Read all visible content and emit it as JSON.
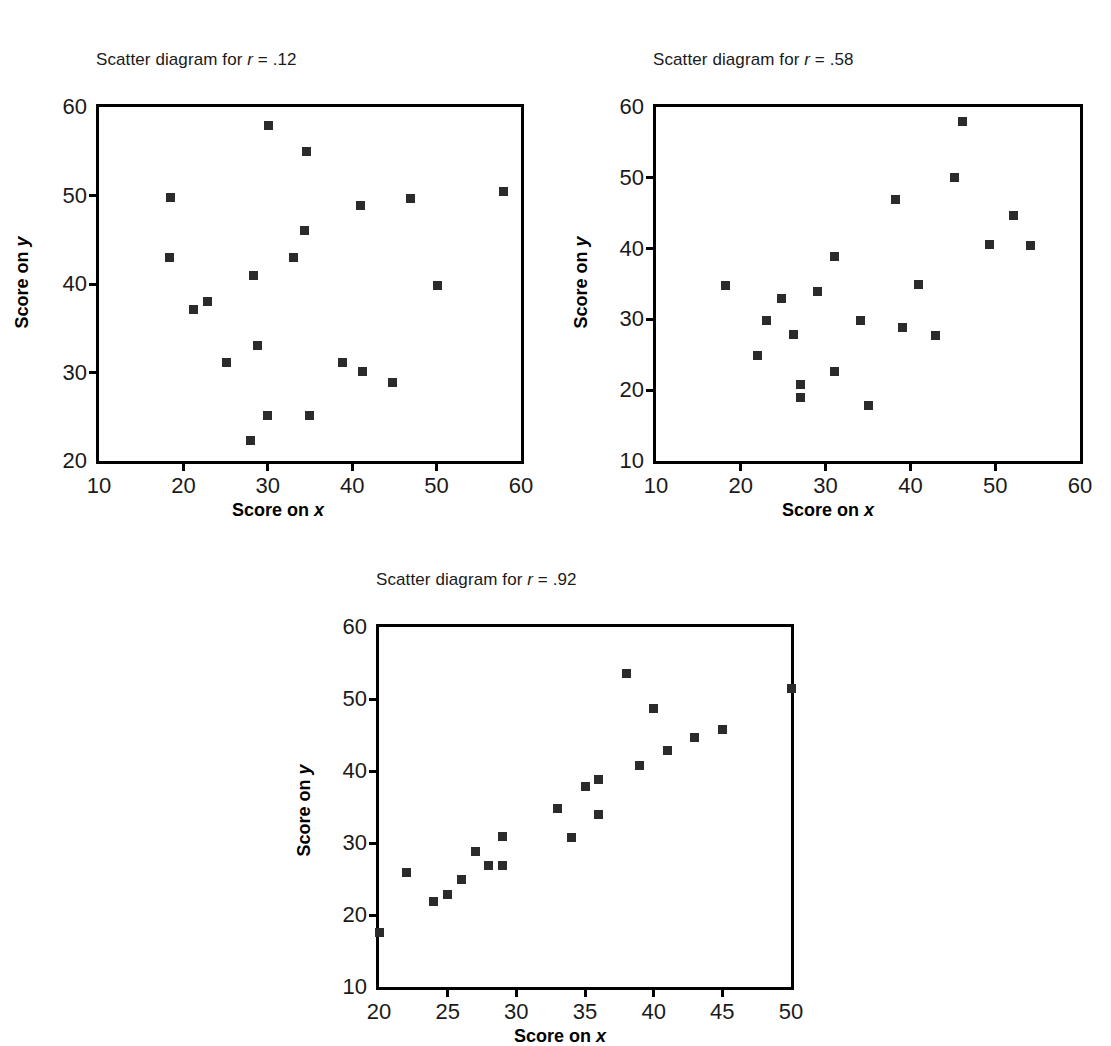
{
  "figure": {
    "background": "#ffffff",
    "marker_color": "#2b2b2b",
    "axis_color": "#000000"
  },
  "chart_data": [
    {
      "id": "scatter-r-012",
      "type": "scatter",
      "title_prefix": "Scatter diagram for ",
      "title_symbol": "r",
      "title_suffix": " = .12",
      "title": "Scatter diagram for r = .12",
      "xlabel_prefix": "Score on ",
      "xlabel_symbol": "x",
      "xlabel": "Score on x",
      "ylabel_prefix": "Score on ",
      "ylabel_symbol": "y",
      "ylabel": "Score on y",
      "xlim": [
        10,
        60
      ],
      "ylim": [
        20,
        60
      ],
      "xticks": [
        10,
        20,
        30,
        40,
        50,
        60
      ],
      "yticks": [
        20,
        30,
        40,
        50,
        60
      ],
      "grid": false,
      "r": 0.12,
      "points": [
        {
          "x": 18.5,
          "y": 49.8
        },
        {
          "x": 18.3,
          "y": 43.0
        },
        {
          "x": 21.2,
          "y": 37.1
        },
        {
          "x": 22.9,
          "y": 38.0
        },
        {
          "x": 25.1,
          "y": 31.1
        },
        {
          "x": 27.9,
          "y": 22.3
        },
        {
          "x": 28.3,
          "y": 41.0
        },
        {
          "x": 28.8,
          "y": 33.1
        },
        {
          "x": 30.0,
          "y": 25.1
        },
        {
          "x": 30.1,
          "y": 57.9
        },
        {
          "x": 33.0,
          "y": 43.0
        },
        {
          "x": 34.4,
          "y": 46.0
        },
        {
          "x": 34.6,
          "y": 55.0
        },
        {
          "x": 34.9,
          "y": 25.1
        },
        {
          "x": 38.9,
          "y": 31.1
        },
        {
          "x": 41.0,
          "y": 48.9
        },
        {
          "x": 41.2,
          "y": 30.1
        },
        {
          "x": 44.8,
          "y": 28.9
        },
        {
          "x": 46.9,
          "y": 49.7
        },
        {
          "x": 50.1,
          "y": 39.8
        },
        {
          "x": 57.9,
          "y": 50.5
        }
      ]
    },
    {
      "id": "scatter-r-058",
      "type": "scatter",
      "title_prefix": "Scatter diagram for ",
      "title_symbol": "r",
      "title_suffix": " = .58",
      "title": "Scatter diagram for r = .58",
      "xlabel_prefix": "Score on ",
      "xlabel_symbol": "x",
      "xlabel": "Score on x",
      "ylabel_prefix": "Score on ",
      "ylabel_symbol": "y",
      "ylabel": "Score on y",
      "xlim": [
        10,
        60
      ],
      "ylim": [
        10,
        60
      ],
      "xticks": [
        10,
        20,
        30,
        40,
        50,
        60
      ],
      "yticks": [
        10,
        20,
        30,
        40,
        50,
        60
      ],
      "grid": false,
      "r": 0.58,
      "points": [
        {
          "x": 18.2,
          "y": 34.8
        },
        {
          "x": 22.0,
          "y": 24.9
        },
        {
          "x": 23.0,
          "y": 29.9
        },
        {
          "x": 24.8,
          "y": 32.9
        },
        {
          "x": 26.2,
          "y": 27.8
        },
        {
          "x": 27.0,
          "y": 20.8
        },
        {
          "x": 27.0,
          "y": 19.0
        },
        {
          "x": 29.0,
          "y": 33.9
        },
        {
          "x": 31.0,
          "y": 38.9
        },
        {
          "x": 31.1,
          "y": 22.7
        },
        {
          "x": 34.1,
          "y": 29.9
        },
        {
          "x": 35.0,
          "y": 17.8
        },
        {
          "x": 38.3,
          "y": 46.9
        },
        {
          "x": 39.1,
          "y": 28.8
        },
        {
          "x": 41.0,
          "y": 34.9
        },
        {
          "x": 43.0,
          "y": 27.7
        },
        {
          "x": 45.2,
          "y": 50.0
        },
        {
          "x": 46.2,
          "y": 57.9
        },
        {
          "x": 49.3,
          "y": 40.6
        },
        {
          "x": 52.2,
          "y": 44.7
        },
        {
          "x": 54.2,
          "y": 40.5
        }
      ]
    },
    {
      "id": "scatter-r-092",
      "type": "scatter",
      "title_prefix": "Scatter diagram for ",
      "title_symbol": "r",
      "title_suffix": " = .92",
      "title": "Scatter diagram for r = .92",
      "xlabel_prefix": "Score on ",
      "xlabel_symbol": "x",
      "xlabel": "Score on x",
      "ylabel_prefix": "Score on ",
      "ylabel_symbol": "y",
      "ylabel": "Score on y",
      "xlim": [
        20,
        50
      ],
      "ylim": [
        10,
        60
      ],
      "xticks": [
        20,
        25,
        30,
        35,
        40,
        45,
        50
      ],
      "yticks": [
        10,
        20,
        30,
        40,
        50,
        60
      ],
      "grid": false,
      "r": 0.92,
      "points": [
        {
          "x": 20.0,
          "y": 17.6
        },
        {
          "x": 22.0,
          "y": 25.9
        },
        {
          "x": 24.0,
          "y": 21.9
        },
        {
          "x": 25.0,
          "y": 22.9
        },
        {
          "x": 26.0,
          "y": 24.9
        },
        {
          "x": 27.0,
          "y": 28.8
        },
        {
          "x": 28.0,
          "y": 26.9
        },
        {
          "x": 29.0,
          "y": 26.9
        },
        {
          "x": 29.0,
          "y": 30.9
        },
        {
          "x": 33.0,
          "y": 34.8
        },
        {
          "x": 34.0,
          "y": 30.8
        },
        {
          "x": 35.0,
          "y": 37.8
        },
        {
          "x": 36.0,
          "y": 38.8
        },
        {
          "x": 36.0,
          "y": 33.9
        },
        {
          "x": 38.0,
          "y": 53.5
        },
        {
          "x": 39.0,
          "y": 40.8
        },
        {
          "x": 40.0,
          "y": 48.7
        },
        {
          "x": 41.0,
          "y": 42.8
        },
        {
          "x": 43.0,
          "y": 44.7
        },
        {
          "x": 45.0,
          "y": 45.7
        },
        {
          "x": 50.0,
          "y": 51.5
        }
      ]
    }
  ]
}
